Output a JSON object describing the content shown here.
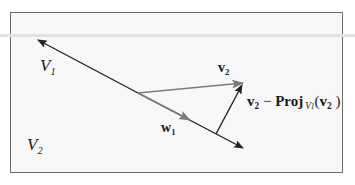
{
  "diagram": {
    "type": "vector-projection (Gram-Schmidt step)",
    "colors": {
      "frame_border": "#6b6b6b",
      "frame_fill": "#f7f7f7",
      "line_dark": "#222222",
      "vector_gray": "#777777",
      "text": "#1a1a1a"
    },
    "labels": {
      "subspace_v1": {
        "base": "V",
        "sub": "1"
      },
      "vector_v2": {
        "base": "v",
        "sub": "2"
      },
      "vector_w1": {
        "base": "w",
        "sub": "1"
      },
      "subspace_v2": {
        "base": "V",
        "sub": "2"
      },
      "orthogonal_component": {
        "v": "v",
        "v_sub": "2",
        "minus": " − ",
        "proj": "Proj",
        "proj_sub_base": "V",
        "proj_sub_sub": "1",
        "arg_open": "(",
        "arg_base": "v",
        "arg_sub": "2",
        "arg_close": " )"
      }
    }
  }
}
